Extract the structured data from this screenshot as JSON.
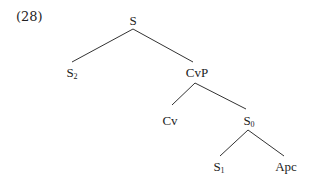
{
  "example_number": "(28)",
  "tree": {
    "nodes": {
      "S": {
        "label": "S",
        "sub": ""
      },
      "S2": {
        "label": "S",
        "sub": "2"
      },
      "CvP": {
        "label": "CvP",
        "sub": ""
      },
      "Cv": {
        "label": "Cv",
        "sub": ""
      },
      "S0": {
        "label": "S",
        "sub": "0"
      },
      "S1": {
        "label": "S",
        "sub": "1"
      },
      "Apc": {
        "label": "Apc",
        "sub": ""
      }
    },
    "edges": [
      [
        "S",
        "S2"
      ],
      [
        "S",
        "CvP"
      ],
      [
        "CvP",
        "Cv"
      ],
      [
        "CvP",
        "S0"
      ],
      [
        "S0",
        "S1"
      ],
      [
        "S0",
        "Apc"
      ]
    ]
  }
}
